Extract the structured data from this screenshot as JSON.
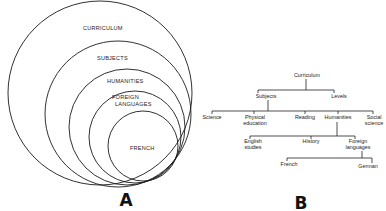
{
  "panels": {
    "a": {
      "label": "A",
      "label_pos": [
        126,
        206
      ],
      "circles": [
        {
          "name": "CURRICULUM",
          "cx": 100,
          "cy": 93,
          "r": 92,
          "text_x": 83,
          "text_y": 30,
          "lines": [
            "CURRICULUM"
          ]
        },
        {
          "name": "SUBJECTS",
          "cx": 118,
          "cy": 114,
          "r": 73,
          "text_x": 97,
          "text_y": 60,
          "lines": [
            "SUBJECTS"
          ]
        },
        {
          "name": "HUMANITIES",
          "cx": 127,
          "cy": 127,
          "r": 58,
          "text_x": 107,
          "text_y": 83,
          "lines": [
            "HUMANITIES"
          ]
        },
        {
          "name": "FOREIGN LANGUAGES",
          "cx": 135,
          "cy": 137,
          "r": 46,
          "text_x": 112,
          "text_y": 99,
          "lines": [
            "FOREIGN",
            "LANGUAGES"
          ]
        },
        {
          "name": "FRENCH",
          "cx": 143,
          "cy": 146,
          "r": 35,
          "text_x": 130,
          "text_y": 150,
          "lines": [
            "FRENCH"
          ]
        }
      ]
    },
    "b": {
      "label": "B",
      "label_pos": [
        301,
        209
      ],
      "nodes": [
        {
          "id": "curriculum",
          "lines": [
            "Curriculum"
          ],
          "x": 307,
          "y": 77
        },
        {
          "id": "subjects",
          "lines": [
            "Subjects"
          ],
          "x": 266,
          "y": 98
        },
        {
          "id": "levels",
          "lines": [
            "Levels"
          ],
          "x": 339,
          "y": 98
        },
        {
          "id": "science",
          "lines": [
            "Science"
          ],
          "x": 212,
          "y": 119
        },
        {
          "id": "physical_education",
          "lines": [
            "Physical",
            "education"
          ],
          "x": 255,
          "y": 119
        },
        {
          "id": "reading",
          "lines": [
            "Reading"
          ],
          "x": 305,
          "y": 119
        },
        {
          "id": "humanities",
          "lines": [
            "Humanities"
          ],
          "x": 338,
          "y": 119
        },
        {
          "id": "social_science",
          "lines": [
            "Social",
            "science"
          ],
          "x": 374,
          "y": 119
        },
        {
          "id": "english_studies",
          "lines": [
            "English",
            "studies"
          ],
          "x": 253,
          "y": 143
        },
        {
          "id": "history",
          "lines": [
            "History"
          ],
          "x": 311,
          "y": 143
        },
        {
          "id": "foreign_languages",
          "lines": [
            "Foreign",
            "languages"
          ],
          "x": 358,
          "y": 143
        },
        {
          "id": "french",
          "lines": [
            "French"
          ],
          "x": 289,
          "y": 166
        },
        {
          "id": "german",
          "lines": [
            "German"
          ],
          "x": 368,
          "y": 168
        }
      ],
      "edges": [
        {
          "parent": "curriculum",
          "stem": [
            306,
            79,
            90
          ],
          "bar": [
            258,
            334,
            90
          ],
          "drops": [
            [
              258,
              90,
              93
            ],
            [
              334,
              90,
              93
            ]
          ]
        },
        {
          "parent": "subjects",
          "stem": [
            268,
            100,
            111
          ],
          "bar": [
            212,
            373,
            111
          ],
          "drops": [
            [
              212,
              111,
              114
            ],
            [
              254,
              111,
              114
            ],
            [
              305,
              111,
              114
            ],
            [
              338,
              111,
              114
            ],
            [
              373,
              111,
              114
            ]
          ]
        },
        {
          "parent": "humanities",
          "stem": [
            337,
            122,
            136
          ],
          "bar": [
            250,
            355,
            136
          ],
          "drops": [
            [
              250,
              136,
              139
            ],
            [
              311,
              136,
              139
            ],
            [
              355,
              136,
              139
            ]
          ]
        },
        {
          "parent": "foreign_languages",
          "stem": [
            362,
            151,
            158
          ],
          "bar": [
            287,
            372,
            158
          ],
          "drops": [
            [
              287,
              158,
              161
            ],
            [
              372,
              158,
              163
            ]
          ]
        }
      ]
    }
  }
}
